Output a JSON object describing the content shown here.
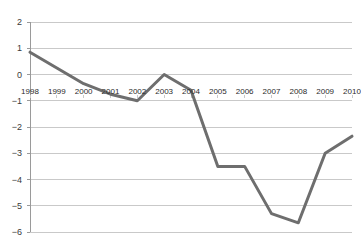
{
  "chart_data": {
    "type": "line",
    "title": "",
    "subtitle": "",
    "xlabel": "",
    "ylabel": "",
    "categories": [
      "1998",
      "1999",
      "2000",
      "2001",
      "2002",
      "2003",
      "2004",
      "2005",
      "2006",
      "2007",
      "2008",
      "2009",
      "2010"
    ],
    "x": [
      1998,
      1999,
      2000,
      2001,
      2002,
      2003,
      2004,
      2005,
      2006,
      2007,
      2008,
      2009,
      2010
    ],
    "values": [
      0.85,
      0.25,
      -0.35,
      -0.75,
      -1.0,
      0.0,
      -0.6,
      -3.5,
      -3.5,
      -5.3,
      -5.65,
      -3.0,
      -2.35
    ],
    "series": [
      {
        "name": "",
        "values": [
          0.85,
          0.25,
          -0.35,
          -0.75,
          -1.0,
          0.0,
          -0.6,
          -3.5,
          -3.5,
          -5.3,
          -5.65,
          -3.0,
          -2.35
        ]
      }
    ],
    "ylim": [
      -6,
      2
    ],
    "xlim": [
      1998,
      2010
    ],
    "yticks": [
      2,
      1,
      0,
      -1,
      -2,
      -3,
      -4,
      -5,
      -6
    ],
    "ytick_labels": [
      "2",
      "1",
      "0",
      "−1",
      "−2",
      "−3",
      "−4",
      "−5",
      "−6"
    ],
    "grid": true,
    "grid_axis": "y",
    "legend": false,
    "legend_position": "none",
    "annotations": [],
    "colors": {
      "line": "#6e6e6e",
      "grid": "#c9c9c9",
      "axis": "#9a9a9a",
      "tick_text": "#3a3a3a",
      "xlabel_text": "#2b2b2b",
      "background": "#ffffff"
    },
    "line_width": 3,
    "markers": false,
    "xlabel_row_value": -0.5
  }
}
